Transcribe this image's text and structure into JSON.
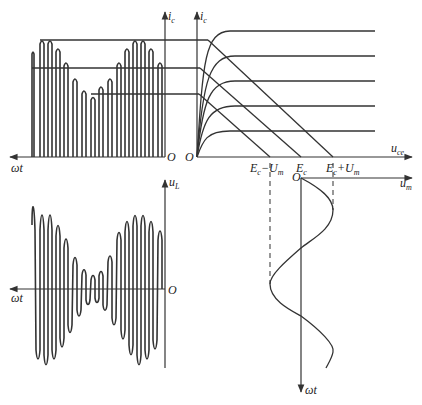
{
  "figure": {
    "type": "amplitude-modulation transistor output characteristics diagram",
    "panels": {
      "top_left": {
        "title": "collector current pulses",
        "y_label": "i",
        "y_label_sub": "c",
        "x_label": "ωt",
        "origin": "O"
      },
      "top_right": {
        "title": "output characteristics with load lines",
        "y_label": "i",
        "y_label_sub": "c",
        "x_label": "u",
        "x_label_sub": "ce",
        "origin": "O",
        "x_ticks": [
          {
            "main": "E",
            "sub": "c",
            "suffix": "−U",
            "suffix_sub": "m"
          },
          {
            "main": "E",
            "sub": "c",
            "suffix": "",
            "suffix_sub": ""
          },
          {
            "main": "E",
            "sub": "c",
            "suffix": "+U",
            "suffix_sub": "m"
          }
        ],
        "curve_count": 5,
        "load_line_count": 3
      },
      "bottom_left": {
        "title": "load voltage waveform",
        "y_label": "u",
        "y_label_sub": "L",
        "x_label": "ωt",
        "origin": "O"
      },
      "bottom_right": {
        "title": "modulating signal",
        "x_label": "u",
        "x_label_sub": "m",
        "y_label": "ωt",
        "origin": "O"
      }
    }
  }
}
